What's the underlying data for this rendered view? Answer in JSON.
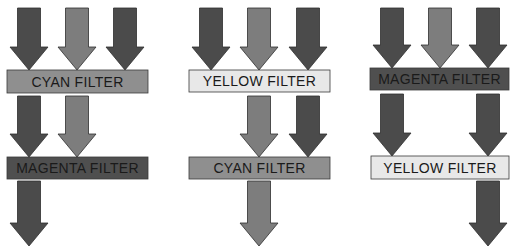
{
  "colors": {
    "background": "#ffffff",
    "arrow_dark": "#4b4b4b",
    "arrow_mid": "#7d7d7d",
    "arrow_stroke": "#2e2e2e",
    "filter_cyan": "#8f8f8f",
    "filter_magenta": "#4f4f4f",
    "filter_yellow": "#e8e8e8",
    "filter_stroke": "#3a3a3a",
    "label_text": "#1a1a1a"
  },
  "panels": [
    {
      "name": "panel-cyan-then-magenta",
      "filters": [
        {
          "label": "CYAN FILTER",
          "type": "cyan",
          "x": 7,
          "y": 70,
          "w": 141,
          "h": 23
        },
        {
          "label": "MAGENTA FILTER",
          "type": "magenta",
          "x": 7,
          "y": 157,
          "w": 141,
          "h": 22
        }
      ],
      "arrows": [
        {
          "cx": 29,
          "y1": 8,
          "y2": 70,
          "tone": "dark"
        },
        {
          "cx": 77,
          "y1": 8,
          "y2": 70,
          "tone": "mid"
        },
        {
          "cx": 125,
          "y1": 8,
          "y2": 70,
          "tone": "dark"
        },
        {
          "cx": 29,
          "y1": 96,
          "y2": 157,
          "tone": "dark"
        },
        {
          "cx": 77,
          "y1": 96,
          "y2": 157,
          "tone": "mid"
        },
        {
          "cx": 29,
          "y1": 181,
          "y2": 246,
          "tone": "dark"
        }
      ]
    },
    {
      "name": "panel-yellow-then-cyan",
      "filters": [
        {
          "label": "YELLOW FILTER",
          "type": "yellow",
          "x": 189,
          "y": 70,
          "w": 141,
          "h": 22
        },
        {
          "label": "CYAN FILTER",
          "type": "cyan",
          "x": 189,
          "y": 157,
          "w": 141,
          "h": 22
        }
      ],
      "arrows": [
        {
          "cx": 211,
          "y1": 8,
          "y2": 70,
          "tone": "dark"
        },
        {
          "cx": 259,
          "y1": 8,
          "y2": 70,
          "tone": "mid"
        },
        {
          "cx": 308,
          "y1": 8,
          "y2": 70,
          "tone": "dark"
        },
        {
          "cx": 259,
          "y1": 96,
          "y2": 157,
          "tone": "mid"
        },
        {
          "cx": 308,
          "y1": 96,
          "y2": 157,
          "tone": "dark"
        },
        {
          "cx": 259,
          "y1": 181,
          "y2": 246,
          "tone": "mid"
        }
      ]
    },
    {
      "name": "panel-magenta-then-yellow",
      "filters": [
        {
          "label": "MAGENTA FILTER",
          "type": "magenta",
          "x": 370,
          "y": 68,
          "w": 139,
          "h": 22
        },
        {
          "label": "YELLOW FILTER",
          "type": "yellow",
          "x": 371,
          "y": 156,
          "w": 138,
          "h": 23
        }
      ],
      "arrows": [
        {
          "cx": 392,
          "y1": 8,
          "y2": 68,
          "tone": "dark"
        },
        {
          "cx": 440,
          "y1": 8,
          "y2": 68,
          "tone": "mid"
        },
        {
          "cx": 488,
          "y1": 8,
          "y2": 68,
          "tone": "dark"
        },
        {
          "cx": 392,
          "y1": 94,
          "y2": 156,
          "tone": "dark"
        },
        {
          "cx": 488,
          "y1": 94,
          "y2": 156,
          "tone": "dark"
        },
        {
          "cx": 488,
          "y1": 181,
          "y2": 246,
          "tone": "dark"
        }
      ]
    }
  ]
}
